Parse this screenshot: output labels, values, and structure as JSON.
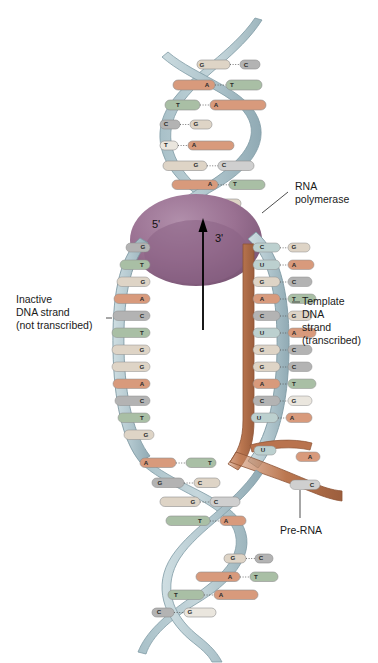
{
  "labels": {
    "rna_polymerase": "RNA\npolymerase",
    "rna_polymerase_line1": "RNA",
    "rna_polymerase_line2": "polymerase",
    "inactive_line1": "Inactive",
    "inactive_line2": "DNA strand",
    "inactive_line3": "(not transcribed)",
    "template_line1": "Template",
    "template_line2": "DNA",
    "template_line3": "strand",
    "template_line4": "(transcribed)",
    "pre_rna": "Pre-RNA",
    "three_prime": "3'",
    "five_prime": "5'"
  },
  "colors": {
    "backbone_dna": "#b9ccd2",
    "backbone_dna_edge": "#7f9aa4",
    "backbone_rna": "#b9734e",
    "backbone_rna_edge": "#8d5335",
    "polymerase": "#9c7494",
    "polymerase_shadow": "#7e5a79",
    "base_A": "#d89a7c",
    "base_T": "#a9bfa5",
    "base_G": "#ded4c6",
    "base_C": "#b3b3b3",
    "base_U": "#bcd0cf",
    "base_edge": "#8d8d8d",
    "text": "#1a1a1a",
    "arrow": "#000000"
  },
  "helix": {
    "top_pairs": [
      {
        "left": "G",
        "right": "C"
      },
      {
        "left": "A",
        "right": "T"
      },
      {
        "left": "T",
        "right": "A"
      },
      {
        "left": "C",
        "right": "G"
      },
      {
        "left": "T",
        "right": "A"
      },
      {
        "left": "G",
        "right": "C"
      },
      {
        "left": "A",
        "right": "T"
      },
      {
        "left": "C",
        "right": "G"
      }
    ],
    "bottom_pairs": [
      {
        "left": "A",
        "right": "T"
      },
      {
        "left": "G",
        "right": "C"
      },
      {
        "left": "G",
        "right": "C"
      },
      {
        "left": "T",
        "right": "A"
      },
      {
        "left": "G",
        "right": "C"
      },
      {
        "left": "A",
        "right": "T"
      },
      {
        "left": "T",
        "right": "A"
      },
      {
        "left": "C",
        "right": "G"
      }
    ]
  },
  "bubble": {
    "inactive_strand_bases": [
      "G",
      "T",
      "G",
      "A",
      "C",
      "T",
      "G",
      "G",
      "A",
      "C",
      "T",
      "G"
    ],
    "template_pairs": [
      {
        "rna": "C",
        "dna": "G"
      },
      {
        "rna": "U",
        "dna": "A"
      },
      {
        "rna": "G",
        "dna": "C"
      },
      {
        "rna": "A",
        "dna": "T"
      },
      {
        "rna": "C",
        "dna": "G"
      },
      {
        "rna": "U",
        "dna": "A"
      },
      {
        "rna": "G",
        "dna": "C"
      },
      {
        "rna": "G",
        "dna": "C"
      },
      {
        "rna": "A",
        "dna": "T"
      },
      {
        "rna": "C",
        "dna": "G"
      },
      {
        "rna": "U",
        "dna": "A"
      }
    ]
  },
  "pre_rna_tail_bases": [
    "U",
    "A",
    "C"
  ]
}
